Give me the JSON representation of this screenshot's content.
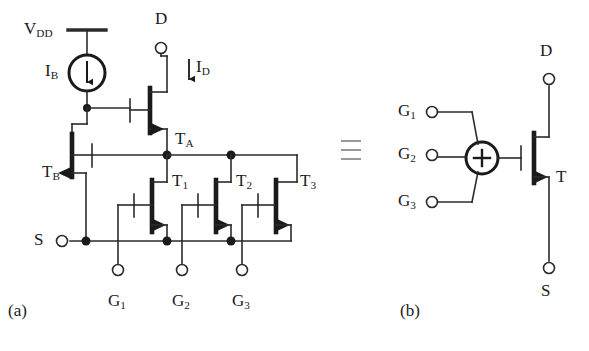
{
  "figure": {
    "type": "schematic",
    "panels": [
      {
        "id": "a",
        "label": "(a)"
      },
      {
        "id": "b",
        "label": "(b)"
      }
    ],
    "equivalence_symbol": "≡"
  },
  "panel_a": {
    "supply": {
      "label": "V",
      "sub": "DD"
    },
    "current_source": {
      "label": "I",
      "sub": "B",
      "direction": "down"
    },
    "drain_current": {
      "label": "I",
      "sub": "D",
      "direction": "down"
    },
    "terminals": [
      {
        "name": "drain",
        "label": "D",
        "x": 161,
        "y": 48
      },
      {
        "name": "source",
        "label": "S",
        "x": 62,
        "y": 241
      },
      {
        "name": "gate1",
        "label": "G",
        "sub": "1",
        "x": 150,
        "y": 285
      },
      {
        "name": "gate2",
        "label": "G",
        "sub": "2",
        "x": 212,
        "y": 285
      },
      {
        "name": "gate3",
        "label": "G",
        "sub": "3",
        "x": 272,
        "y": 285
      }
    ],
    "transistors": [
      {
        "name": "TA",
        "label": "T",
        "sub": "A",
        "role": "output-cascode"
      },
      {
        "name": "TB",
        "label": "T",
        "sub": "B",
        "role": "bias-mirror",
        "mirrored": true
      },
      {
        "name": "T1",
        "label": "T",
        "sub": "1",
        "role": "input-1"
      },
      {
        "name": "T2",
        "label": "T",
        "sub": "2",
        "role": "input-2"
      },
      {
        "name": "T3",
        "label": "T",
        "sub": "3",
        "role": "input-3"
      }
    ]
  },
  "panel_b": {
    "summing_node": {
      "symbol": "+",
      "name": "summing-junction"
    },
    "terminals": [
      {
        "name": "drain",
        "label": "D",
        "x": 546,
        "y": 79
      },
      {
        "name": "source",
        "label": "S",
        "x": 546,
        "y": 268
      },
      {
        "name": "gate1",
        "label": "G",
        "sub": "1",
        "x": 432,
        "y": 112
      },
      {
        "name": "gate2",
        "label": "G",
        "sub": "2",
        "x": 432,
        "y": 155
      },
      {
        "name": "gate3",
        "label": "G",
        "sub": "3",
        "x": 432,
        "y": 202
      }
    ],
    "transistor": {
      "name": "T",
      "label": "T",
      "role": "equivalent-device"
    }
  },
  "colors": {
    "ink": "#1a1a1a",
    "wire": "#2b2b2b",
    "background": "#ffffff",
    "equiv": "#555555"
  }
}
